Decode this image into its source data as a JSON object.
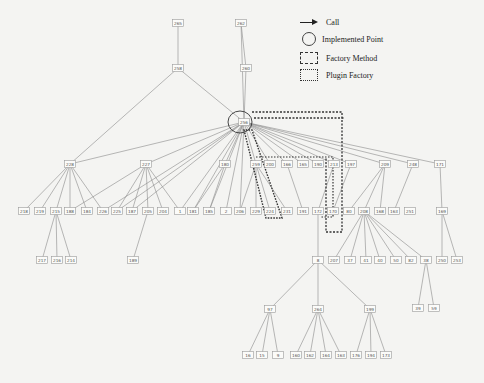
{
  "legend": [
    {
      "symbol": "arrow",
      "label": "Call"
    },
    {
      "symbol": "circle",
      "label": "Implemented Point"
    },
    {
      "symbol": "dashed-box",
      "label": "Factory Method"
    },
    {
      "symbol": "dotted-box",
      "label": "Plugin Factory"
    }
  ],
  "colors": {
    "background": "#f4f4f2",
    "edge": "#8a8a8a",
    "node_border": "#9a9a9a",
    "highlight": "#333333"
  },
  "nodes": [
    {
      "id": "n265",
      "label": "265"
    },
    {
      "id": "n262",
      "label": "262"
    },
    {
      "id": "n258",
      "label": "258"
    },
    {
      "id": "n260",
      "label": "260"
    },
    {
      "id": "hub",
      "label": "256"
    },
    {
      "id": "n259",
      "label": "259"
    },
    {
      "id": "n228",
      "label": "228"
    },
    {
      "id": "n227",
      "label": "227"
    },
    {
      "id": "n180",
      "label": "180"
    },
    {
      "id": "n200",
      "label": "200"
    },
    {
      "id": "n166",
      "label": "166"
    },
    {
      "id": "n165",
      "label": "165"
    },
    {
      "id": "n190",
      "label": "190"
    },
    {
      "id": "n213",
      "label": "213"
    },
    {
      "id": "n197",
      "label": "197"
    },
    {
      "id": "n209",
      "label": "209"
    },
    {
      "id": "n248",
      "label": "248"
    },
    {
      "id": "n171",
      "label": "171"
    },
    {
      "id": "l218",
      "label": "218"
    },
    {
      "id": "l219",
      "label": "219"
    },
    {
      "id": "l215",
      "label": "215"
    },
    {
      "id": "l188",
      "label": "188"
    },
    {
      "id": "l184",
      "label": "184"
    },
    {
      "id": "l226",
      "label": "226"
    },
    {
      "id": "l225",
      "label": "225"
    },
    {
      "id": "l187",
      "label": "187"
    },
    {
      "id": "l205",
      "label": "205"
    },
    {
      "id": "l204",
      "label": "204"
    },
    {
      "id": "l1",
      "label": "1"
    },
    {
      "id": "l181",
      "label": "181"
    },
    {
      "id": "l185",
      "label": "185"
    },
    {
      "id": "l2",
      "label": "2"
    },
    {
      "id": "l206",
      "label": "206"
    },
    {
      "id": "l229",
      "label": "229"
    },
    {
      "id": "l224",
      "label": "224"
    },
    {
      "id": "l231",
      "label": "231"
    },
    {
      "id": "l191",
      "label": "191"
    },
    {
      "id": "l172",
      "label": "172"
    },
    {
      "id": "l170",
      "label": "170"
    },
    {
      "id": "l80",
      "label": "80"
    },
    {
      "id": "l208",
      "label": "208"
    },
    {
      "id": "l168",
      "label": "168"
    },
    {
      "id": "l163",
      "label": "163"
    },
    {
      "id": "l251",
      "label": "251"
    },
    {
      "id": "l169",
      "label": "169"
    },
    {
      "id": "m217",
      "label": "217"
    },
    {
      "id": "m216",
      "label": "216"
    },
    {
      "id": "m214",
      "label": "214"
    },
    {
      "id": "m189",
      "label": "189"
    },
    {
      "id": "m8",
      "label": "8"
    },
    {
      "id": "m207",
      "label": "207"
    },
    {
      "id": "m37",
      "label": "37"
    },
    {
      "id": "m41",
      "label": "41"
    },
    {
      "id": "m40",
      "label": "40"
    },
    {
      "id": "m50",
      "label": "50"
    },
    {
      "id": "m82",
      "label": "82"
    },
    {
      "id": "m38",
      "label": "38"
    },
    {
      "id": "m250",
      "label": "250"
    },
    {
      "id": "m253",
      "label": "253"
    },
    {
      "id": "m39",
      "label": "39"
    },
    {
      "id": "m59",
      "label": "59"
    },
    {
      "id": "p97",
      "label": "97"
    },
    {
      "id": "p264",
      "label": "264"
    },
    {
      "id": "p199",
      "label": "199"
    },
    {
      "id": "q16",
      "label": "16"
    },
    {
      "id": "q15",
      "label": "15"
    },
    {
      "id": "q9",
      "label": "9"
    },
    {
      "id": "q160",
      "label": "160"
    },
    {
      "id": "q162",
      "label": "162"
    },
    {
      "id": "q164",
      "label": "164"
    },
    {
      "id": "q163",
      "label": "163"
    },
    {
      "id": "q176",
      "label": "176"
    },
    {
      "id": "q194",
      "label": "194"
    },
    {
      "id": "q173",
      "label": "173"
    }
  ]
}
